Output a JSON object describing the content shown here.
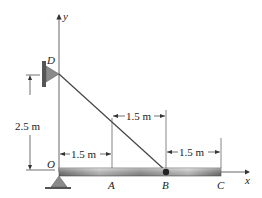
{
  "diagram": {
    "points": {
      "O": "O",
      "A": "A",
      "B": "B",
      "C": "C",
      "D": "D"
    },
    "axes": {
      "x": "x",
      "y": "y"
    },
    "dimensions": {
      "vertical_OD": "2.5 m",
      "OA": "1.5 m",
      "AB": "1.5 m",
      "BC": "1.5 m"
    },
    "colors": {
      "beam_dark": "#6f6f6f",
      "beam_light": "#d8d8d8",
      "support": "#8a8a8a",
      "line": "#333333"
    }
  }
}
